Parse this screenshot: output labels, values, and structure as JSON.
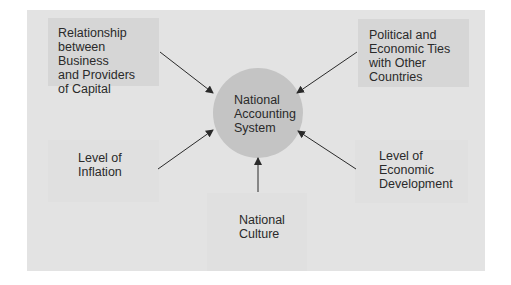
{
  "diagram": {
    "center": {
      "label_lines": [
        "National",
        "Accounting",
        "System"
      ]
    },
    "factors": [
      {
        "id": "business-capital",
        "lines": [
          "Relationship",
          "between Business",
          "and Providers",
          "of Capital"
        ]
      },
      {
        "id": "political-economic-ties",
        "lines": [
          "Political and",
          "Economic Ties",
          "with Other",
          "Countries"
        ]
      },
      {
        "id": "inflation",
        "lines": [
          "Level of",
          "Inflation"
        ]
      },
      {
        "id": "economic-development",
        "lines": [
          "Level of",
          "Economic",
          "Development"
        ]
      },
      {
        "id": "national-culture",
        "lines": [
          "National",
          "Culture"
        ]
      }
    ],
    "colors": {
      "panel": "#e3e3e3",
      "box": "#d6d6d6",
      "circle": "#c4c4c4",
      "arrow": "#2a2a2a"
    }
  }
}
